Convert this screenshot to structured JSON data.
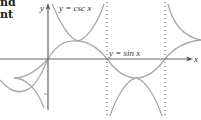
{
  "header_fragment": {
    "line1": "nd",
    "line2": "nt"
  },
  "graph": {
    "y_axis_label": "y",
    "x_axis_label": "x",
    "curves": [
      {
        "name": "cosecant",
        "label": "y = csc x"
      },
      {
        "name": "sine",
        "label": "y = sin x"
      }
    ],
    "asymptotes": [
      "x = π",
      "x = 2π"
    ],
    "colors": {
      "axis": "#666666",
      "curve": "#a8a8a8",
      "asymptote": "#555555",
      "text": "#333333"
    }
  }
}
